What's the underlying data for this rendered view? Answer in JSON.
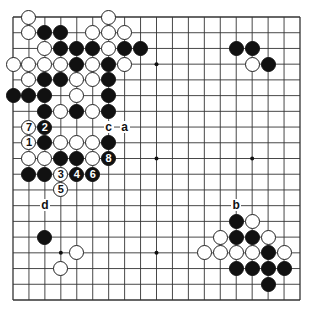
{
  "diagram": {
    "type": "go-board",
    "size": 19,
    "grid": {
      "left": 13,
      "top": 17,
      "right": 300,
      "bottom": 300
    },
    "colors": {
      "line": "#333333",
      "black": "#111111",
      "white": "#ffffff",
      "background": "#ffffff"
    },
    "star_points": [
      [
        3,
        3
      ],
      [
        9,
        3
      ],
      [
        15,
        3
      ],
      [
        3,
        9
      ],
      [
        9,
        9
      ],
      [
        15,
        9
      ],
      [
        3,
        15
      ],
      [
        9,
        15
      ],
      [
        15,
        15
      ]
    ],
    "stones": [
      {
        "c": "W",
        "x": 1,
        "y": 0
      },
      {
        "c": "W",
        "x": 6,
        "y": 0
      },
      {
        "c": "W",
        "x": 1,
        "y": 1
      },
      {
        "c": "B",
        "x": 2,
        "y": 1
      },
      {
        "c": "B",
        "x": 3,
        "y": 1
      },
      {
        "c": "W",
        "x": 5,
        "y": 1
      },
      {
        "c": "W",
        "x": 6,
        "y": 1
      },
      {
        "c": "W",
        "x": 7,
        "y": 1
      },
      {
        "c": "W",
        "x": 2,
        "y": 2
      },
      {
        "c": "B",
        "x": 3,
        "y": 2
      },
      {
        "c": "B",
        "x": 4,
        "y": 2
      },
      {
        "c": "B",
        "x": 5,
        "y": 2
      },
      {
        "c": "W",
        "x": 6,
        "y": 2
      },
      {
        "c": "B",
        "x": 7,
        "y": 2
      },
      {
        "c": "B",
        "x": 8,
        "y": 2
      },
      {
        "c": "B",
        "x": 14,
        "y": 2
      },
      {
        "c": "B",
        "x": 15,
        "y": 2
      },
      {
        "c": "W",
        "x": 0,
        "y": 3
      },
      {
        "c": "W",
        "x": 1,
        "y": 3
      },
      {
        "c": "W",
        "x": 2,
        "y": 3
      },
      {
        "c": "W",
        "x": 3,
        "y": 3
      },
      {
        "c": "B",
        "x": 4,
        "y": 3
      },
      {
        "c": "W",
        "x": 5,
        "y": 3
      },
      {
        "c": "B",
        "x": 6,
        "y": 3
      },
      {
        "c": "W",
        "x": 7,
        "y": 3
      },
      {
        "c": "W",
        "x": 15,
        "y": 3
      },
      {
        "c": "B",
        "x": 16,
        "y": 3
      },
      {
        "c": "W",
        "x": 1,
        "y": 4
      },
      {
        "c": "B",
        "x": 2,
        "y": 4
      },
      {
        "c": "B",
        "x": 3,
        "y": 4
      },
      {
        "c": "W",
        "x": 4,
        "y": 4
      },
      {
        "c": "W",
        "x": 5,
        "y": 4
      },
      {
        "c": "B",
        "x": 6,
        "y": 4
      },
      {
        "c": "B",
        "x": 0,
        "y": 5
      },
      {
        "c": "B",
        "x": 1,
        "y": 5
      },
      {
        "c": "B",
        "x": 2,
        "y": 5
      },
      {
        "c": "W",
        "x": 4,
        "y": 5
      },
      {
        "c": "B",
        "x": 6,
        "y": 5
      },
      {
        "c": "B",
        "x": 2,
        "y": 6
      },
      {
        "c": "W",
        "x": 3,
        "y": 6
      },
      {
        "c": "B",
        "x": 4,
        "y": 6
      },
      {
        "c": "W",
        "x": 5,
        "y": 6
      },
      {
        "c": "B",
        "x": 6,
        "y": 6
      },
      {
        "c": "W",
        "x": 1,
        "y": 7,
        "n": "7"
      },
      {
        "c": "B",
        "x": 2,
        "y": 7,
        "n": "2"
      },
      {
        "c": "W",
        "x": 1,
        "y": 8,
        "n": "1"
      },
      {
        "c": "B",
        "x": 2,
        "y": 8
      },
      {
        "c": "W",
        "x": 3,
        "y": 8
      },
      {
        "c": "W",
        "x": 4,
        "y": 8
      },
      {
        "c": "W",
        "x": 5,
        "y": 8
      },
      {
        "c": "B",
        "x": 6,
        "y": 8
      },
      {
        "c": "W",
        "x": 1,
        "y": 9
      },
      {
        "c": "W",
        "x": 2,
        "y": 9
      },
      {
        "c": "B",
        "x": 3,
        "y": 9
      },
      {
        "c": "B",
        "x": 4,
        "y": 9
      },
      {
        "c": "W",
        "x": 5,
        "y": 9
      },
      {
        "c": "B",
        "x": 6,
        "y": 9,
        "n": "8"
      },
      {
        "c": "B",
        "x": 1,
        "y": 10
      },
      {
        "c": "B",
        "x": 2,
        "y": 10
      },
      {
        "c": "W",
        "x": 3,
        "y": 10,
        "n": "3"
      },
      {
        "c": "B",
        "x": 4,
        "y": 10,
        "n": "4"
      },
      {
        "c": "B",
        "x": 5,
        "y": 10,
        "n": "6"
      },
      {
        "c": "W",
        "x": 3,
        "y": 11,
        "n": "5"
      },
      {
        "c": "B",
        "x": 14,
        "y": 13
      },
      {
        "c": "W",
        "x": 15,
        "y": 13
      },
      {
        "c": "B",
        "x": 2,
        "y": 14
      },
      {
        "c": "W",
        "x": 13,
        "y": 14
      },
      {
        "c": "B",
        "x": 14,
        "y": 14
      },
      {
        "c": "B",
        "x": 15,
        "y": 14
      },
      {
        "c": "W",
        "x": 16,
        "y": 14
      },
      {
        "c": "W",
        "x": 4,
        "y": 15
      },
      {
        "c": "W",
        "x": 12,
        "y": 15
      },
      {
        "c": "W",
        "x": 13,
        "y": 15
      },
      {
        "c": "W",
        "x": 14,
        "y": 15
      },
      {
        "c": "W",
        "x": 15,
        "y": 15
      },
      {
        "c": "B",
        "x": 16,
        "y": 15
      },
      {
        "c": "W",
        "x": 17,
        "y": 15
      },
      {
        "c": "W",
        "x": 3,
        "y": 16
      },
      {
        "c": "B",
        "x": 14,
        "y": 16
      },
      {
        "c": "B",
        "x": 15,
        "y": 16
      },
      {
        "c": "B",
        "x": 16,
        "y": 16
      },
      {
        "c": "B",
        "x": 17,
        "y": 16
      },
      {
        "c": "B",
        "x": 16,
        "y": 17
      }
    ],
    "labels": [
      {
        "t": "c",
        "x": 6,
        "y": 7
      },
      {
        "t": "a",
        "x": 7,
        "y": 7
      },
      {
        "t": "d",
        "x": 2,
        "y": 12
      },
      {
        "t": "b",
        "x": 14,
        "y": 12
      }
    ]
  }
}
